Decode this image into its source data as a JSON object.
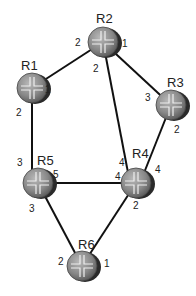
{
  "diagram": {
    "type": "network-topology",
    "routers": [
      {
        "id": "R1",
        "label": "R1",
        "x": 32,
        "y": 88
      },
      {
        "id": "R2",
        "label": "R2",
        "x": 103,
        "y": 42
      },
      {
        "id": "R3",
        "label": "R3",
        "x": 171,
        "y": 105
      },
      {
        "id": "R4",
        "label": "R4",
        "x": 136,
        "y": 183
      },
      {
        "id": "R5",
        "label": "R5",
        "x": 38,
        "y": 183
      },
      {
        "id": "R6",
        "label": "R6",
        "x": 82,
        "y": 266
      }
    ],
    "links": [
      {
        "from": "R1",
        "from_port": "1",
        "to": "R2",
        "to_port": "2"
      },
      {
        "from": "R2",
        "from_port": "1",
        "to": "R3",
        "to_port": "3"
      },
      {
        "from": "R2",
        "from_port": "2",
        "to": "R4",
        "to_port": "4"
      },
      {
        "from": "R3",
        "from_port": "2",
        "to": "R4",
        "to_port": "4"
      },
      {
        "from": "R1",
        "from_port": "2",
        "to": "R5",
        "to_port": "3"
      },
      {
        "from": "R5",
        "from_port": "5",
        "to": "R4",
        "to_port": "4"
      },
      {
        "from": "R5",
        "from_port": "3",
        "to": "R6",
        "to_port": "2"
      },
      {
        "from": "R4",
        "from_port": "2",
        "to": "R6",
        "to_port": "1"
      }
    ],
    "colors": {
      "link": "#111111",
      "router_fill": "#8a8a8a",
      "router_edge": "#333333",
      "text": "#222222"
    }
  },
  "labels": {
    "r1": "R1",
    "r2": "R2",
    "r3": "R3",
    "r4": "R4",
    "r5": "R5",
    "r6": "R6",
    "p_r1_1": "1",
    "p_r1_2": "2",
    "p_r2_2": "2",
    "p_r2_1": "1",
    "p_r2_2b": "2",
    "p_r3_3": "3",
    "p_r3_2": "2",
    "p_r4_4a": "4",
    "p_r4_4b": "4",
    "p_r4_4c": "4",
    "p_r4_2": "2",
    "p_r5_3a": "3",
    "p_r5_5": "5",
    "p_r5_3b": "3",
    "p_r6_2": "2",
    "p_r6_1": "1"
  }
}
